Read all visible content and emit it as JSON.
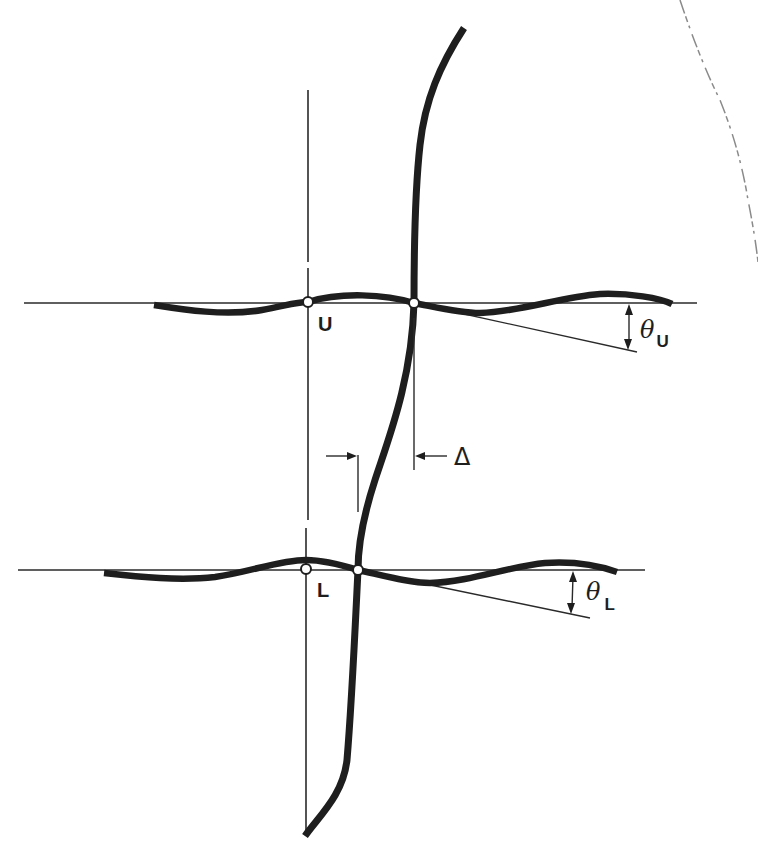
{
  "figure": {
    "type": "structural frame deflection diagram"
  },
  "labels": {
    "upper_node": "U",
    "lower_node": "L",
    "theta_upper_symbol": "θ",
    "theta_upper_sub": "U",
    "theta_lower_symbol": "θ",
    "theta_lower_sub": "L",
    "drift_symbol": "Δ"
  },
  "colors": {
    "ink": "#1e1e1e",
    "background": "#ffffff",
    "smudge": "#8a8a8a"
  }
}
